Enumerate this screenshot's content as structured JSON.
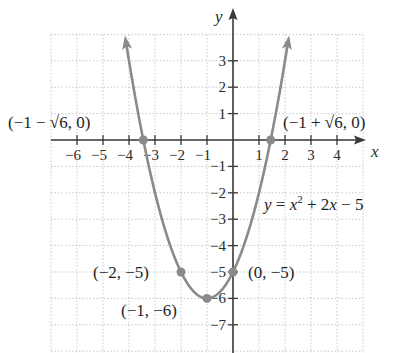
{
  "chart_data": {
    "type": "line",
    "title": "",
    "function": "y = x^2 + 2x - 5",
    "equation_label": {
      "y": "y",
      "eq": " = ",
      "x": "x",
      "exp": "2",
      "rest": " + 2",
      "x2": "x",
      "tail": " − 5"
    },
    "xlabel": "x",
    "ylabel": "y",
    "xlim": [
      -7,
      5
    ],
    "ylim": [
      -8,
      4
    ],
    "grid": true,
    "x_ticks": [
      -6,
      -5,
      -4,
      -3,
      -2,
      -1,
      1,
      2,
      3,
      4
    ],
    "x_tick_labels": [
      "−6",
      "−5",
      "−4",
      "−3",
      "−2",
      "−1",
      "1",
      "2",
      "3",
      "4"
    ],
    "y_ticks": [
      3,
      2,
      1,
      -1,
      -2,
      -3,
      -4,
      -5,
      -6,
      -7
    ],
    "y_tick_labels": [
      "3",
      "2",
      "1",
      "−1",
      "−2",
      "−3",
      "−4",
      "−5",
      "−6",
      "−7"
    ],
    "series": [
      {
        "name": "y = x^2 + 2x - 5",
        "x": [
          -4.16,
          -4,
          -3.449,
          -3,
          -2,
          -1,
          0,
          1,
          1.449,
          2,
          2.16
        ],
        "y": [
          4.0,
          3.0,
          0.0,
          -2.0,
          -5.0,
          -6.0,
          -5.0,
          -2.0,
          0.0,
          3.0,
          4.0
        ],
        "color": "#8a8a8a",
        "arrows_at_ends": true
      }
    ],
    "points": [
      {
        "x": -3.449,
        "y": 0,
        "label": "(−1 − √6, 0)"
      },
      {
        "x": 1.449,
        "y": 0,
        "label": "(−1 + √6, 0)"
      },
      {
        "x": -2,
        "y": -5,
        "label": "(−2, −5)"
      },
      {
        "x": -1,
        "y": -6,
        "label": "(−1, −6)"
      },
      {
        "x": 0,
        "y": -5,
        "label": "(0, −5)"
      }
    ],
    "annotations": {
      "root_left": "(−1 − √6, 0)",
      "root_right": "(−1 + √6, 0)",
      "point_m2": "(−2, −5)",
      "vertex": "(−1, −6)",
      "y_intercept": "(0, −5)"
    },
    "colors": {
      "curve": "#8a8a8a",
      "points": "#8a8a8a",
      "axes": "#3a3a3a",
      "grid": "#c8c8c8"
    }
  }
}
